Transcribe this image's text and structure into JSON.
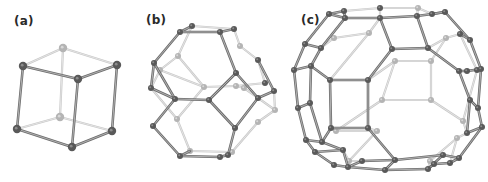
{
  "figure": {
    "panels": [
      {
        "id": "a",
        "label": "(a)",
        "shape": "cube",
        "label_pos": [
          14,
          14
        ]
      },
      {
        "id": "b",
        "label": "(b)",
        "shape": "truncated-octahedron",
        "label_pos": [
          146,
          13
        ]
      },
      {
        "id": "c",
        "label": "(c)",
        "shape": "truncated-cuboctahedron",
        "label_pos": [
          301,
          13
        ]
      }
    ],
    "colors": {
      "front_edge": "#6e6e6e",
      "back_edge": "#c8c8c8",
      "front_node": "#595959",
      "back_node": "#b4b4b4",
      "label": "#2a2a2a"
    },
    "models": {
      "a": {
        "nodes": [
          [
            63,
            48,
            0
          ],
          [
            23,
            66,
            1
          ],
          [
            117,
            65,
            1
          ],
          [
            78,
            79,
            1
          ],
          [
            60,
            117,
            0
          ],
          [
            17,
            129,
            1
          ],
          [
            112,
            131,
            1
          ],
          [
            72,
            147,
            1
          ]
        ],
        "edges": [
          [
            0,
            1,
            0
          ],
          [
            0,
            2,
            0
          ],
          [
            1,
            3,
            1
          ],
          [
            2,
            3,
            1
          ],
          [
            4,
            5,
            0
          ],
          [
            4,
            6,
            0
          ],
          [
            5,
            7,
            1
          ],
          [
            6,
            7,
            1
          ],
          [
            0,
            4,
            0
          ],
          [
            1,
            5,
            1
          ],
          [
            2,
            6,
            1
          ],
          [
            3,
            7,
            1
          ]
        ]
      },
      "b": {
        "nodes": [
          [
            180,
            32,
            1
          ],
          [
            192,
            26,
            1
          ],
          [
            220,
            32,
            1
          ],
          [
            234,
            29,
            1
          ],
          [
            154,
            63,
            1
          ],
          [
            178,
            56,
            0
          ],
          [
            240,
            46,
            0
          ],
          [
            258,
            60,
            1
          ],
          [
            151,
            88,
            1
          ],
          [
            160,
            70,
            0
          ],
          [
            204,
            87,
            0
          ],
          [
            236,
            86,
            0
          ],
          [
            265,
            83,
            1
          ],
          [
            175,
            99,
            1
          ],
          [
            209,
            100,
            1
          ],
          [
            236,
            73,
            1
          ],
          [
            258,
            98,
            1
          ],
          [
            274,
            91,
            1
          ],
          [
            244,
            88,
            0
          ],
          [
            275,
            110,
            0
          ],
          [
            153,
            126,
            1
          ],
          [
            177,
            119,
            0
          ],
          [
            235,
            128,
            1
          ],
          [
            258,
            122,
            0
          ],
          [
            180,
            156,
            1
          ],
          [
            190,
            151,
            0
          ],
          [
            220,
            157,
            1
          ],
          [
            232,
            152,
            0
          ],
          [
            228,
            155,
            1
          ]
        ],
        "edges": [
          [
            0,
            1,
            1
          ],
          [
            1,
            3,
            0
          ],
          [
            0,
            2,
            1
          ],
          [
            2,
            3,
            1
          ],
          [
            0,
            4,
            1
          ],
          [
            1,
            5,
            0
          ],
          [
            3,
            6,
            0
          ],
          [
            2,
            15,
            1
          ],
          [
            6,
            7,
            0
          ],
          [
            4,
            8,
            1
          ],
          [
            5,
            9,
            0
          ],
          [
            8,
            9,
            0
          ],
          [
            4,
            13,
            1
          ],
          [
            9,
            10,
            0
          ],
          [
            10,
            11,
            0
          ],
          [
            10,
            21,
            0
          ],
          [
            5,
            10,
            0
          ],
          [
            8,
            13,
            1
          ],
          [
            13,
            14,
            1
          ],
          [
            14,
            15,
            1
          ],
          [
            15,
            16,
            1
          ],
          [
            16,
            17,
            1
          ],
          [
            7,
            17,
            1
          ],
          [
            7,
            12,
            0
          ],
          [
            11,
            12,
            0
          ],
          [
            11,
            18,
            0
          ],
          [
            18,
            19,
            0
          ],
          [
            17,
            19,
            0
          ],
          [
            13,
            20,
            1
          ],
          [
            20,
            24,
            1
          ],
          [
            8,
            21,
            0
          ],
          [
            21,
            25,
            0
          ],
          [
            24,
            25,
            1
          ],
          [
            24,
            26,
            1
          ],
          [
            25,
            27,
            0
          ],
          [
            26,
            27,
            0
          ],
          [
            26,
            28,
            1
          ],
          [
            14,
            22,
            1
          ],
          [
            22,
            28,
            1
          ],
          [
            16,
            22,
            1
          ],
          [
            19,
            23,
            0
          ],
          [
            23,
            27,
            0
          ]
        ]
      },
      "c": {
        "nodes": [
          [
            329,
            14,
            1
          ],
          [
            344,
            11,
            1
          ],
          [
            345,
            18,
            1
          ],
          [
            380,
            8,
            1
          ],
          [
            418,
            8,
            0
          ],
          [
            432,
            14,
            1
          ],
          [
            445,
            12,
            1
          ],
          [
            380,
            18,
            1
          ],
          [
            417,
            16,
            1
          ],
          [
            305,
            44,
            1
          ],
          [
            321,
            48,
            1
          ],
          [
            334,
            38,
            0
          ],
          [
            369,
            33,
            0
          ],
          [
            392,
            49,
            1
          ],
          [
            428,
            48,
            1
          ],
          [
            446,
            38,
            0
          ],
          [
            460,
            34,
            1
          ],
          [
            470,
            40,
            1
          ],
          [
            294,
            70,
            1
          ],
          [
            311,
            66,
            1
          ],
          [
            330,
            80,
            1
          ],
          [
            368,
            80,
            1
          ],
          [
            395,
            61,
            0
          ],
          [
            431,
            61,
            0
          ],
          [
            459,
            71,
            1
          ],
          [
            467,
            71,
            1
          ],
          [
            477,
            70,
            1
          ],
          [
            481,
            69,
            1
          ],
          [
            298,
            108,
            1
          ],
          [
            310,
            103,
            1
          ],
          [
            382,
            100,
            0
          ],
          [
            431,
            100,
            0
          ],
          [
            470,
            100,
            1
          ],
          [
            478,
            108,
            1
          ],
          [
            306,
            140,
            1
          ],
          [
            322,
            142,
            1
          ],
          [
            331,
            128,
            1
          ],
          [
            368,
            128,
            1
          ],
          [
            336,
            131,
            0
          ],
          [
            377,
            131,
            0
          ],
          [
            463,
            121,
            0
          ],
          [
            467,
            133,
            1
          ],
          [
            482,
            127,
            1
          ],
          [
            315,
            152,
            1
          ],
          [
            343,
            150,
            1
          ],
          [
            349,
            161,
            0
          ],
          [
            362,
            161,
            1
          ],
          [
            395,
            160,
            1
          ],
          [
            430,
            161,
            0
          ],
          [
            443,
            155,
            1
          ],
          [
            457,
            138,
            0
          ],
          [
            459,
            158,
            1
          ],
          [
            334,
            165,
            1
          ],
          [
            348,
            167,
            1
          ],
          [
            385,
            170,
            1
          ],
          [
            428,
            169,
            1
          ],
          [
            434,
            164,
            1
          ],
          [
            450,
            163,
            1
          ]
        ],
        "edges": [
          [
            0,
            1,
            1
          ],
          [
            1,
            2,
            1
          ],
          [
            0,
            2,
            1
          ],
          [
            2,
            7,
            1
          ],
          [
            1,
            3,
            0
          ],
          [
            3,
            7,
            0
          ],
          [
            3,
            4,
            0
          ],
          [
            4,
            8,
            0
          ],
          [
            7,
            8,
            1
          ],
          [
            4,
            5,
            0
          ],
          [
            5,
            6,
            1
          ],
          [
            8,
            5,
            1
          ],
          [
            6,
            5,
            1
          ],
          [
            0,
            9,
            1
          ],
          [
            2,
            10,
            1
          ],
          [
            9,
            10,
            1
          ],
          [
            10,
            11,
            0
          ],
          [
            11,
            12,
            0
          ],
          [
            12,
            7,
            0
          ],
          [
            12,
            20,
            0
          ],
          [
            7,
            13,
            1
          ],
          [
            13,
            14,
            1
          ],
          [
            14,
            8,
            1
          ],
          [
            14,
            15,
            0
          ],
          [
            15,
            16,
            0
          ],
          [
            6,
            17,
            1
          ],
          [
            16,
            17,
            1
          ],
          [
            9,
            18,
            1
          ],
          [
            18,
            19,
            1
          ],
          [
            10,
            19,
            1
          ],
          [
            19,
            20,
            1
          ],
          [
            20,
            21,
            1
          ],
          [
            21,
            13,
            1
          ],
          [
            21,
            22,
            0
          ],
          [
            22,
            23,
            0
          ],
          [
            23,
            15,
            0
          ],
          [
            14,
            24,
            1
          ],
          [
            24,
            25,
            1
          ],
          [
            25,
            27,
            1
          ],
          [
            17,
            27,
            1
          ],
          [
            16,
            26,
            0
          ],
          [
            26,
            25,
            0
          ],
          [
            18,
            28,
            1
          ],
          [
            19,
            29,
            1
          ],
          [
            28,
            29,
            1
          ],
          [
            20,
            36,
            1
          ],
          [
            21,
            37,
            1
          ],
          [
            36,
            37,
            1
          ],
          [
            22,
            30,
            0
          ],
          [
            30,
            31,
            0
          ],
          [
            23,
            31,
            0
          ],
          [
            24,
            32,
            1
          ],
          [
            27,
            33,
            1
          ],
          [
            32,
            33,
            1
          ],
          [
            26,
            40,
            0
          ],
          [
            28,
            34,
            1
          ],
          [
            29,
            35,
            1
          ],
          [
            34,
            35,
            1
          ],
          [
            35,
            36,
            1
          ],
          [
            36,
            38,
            0
          ],
          [
            37,
            39,
            0
          ],
          [
            38,
            39,
            0
          ],
          [
            30,
            38,
            0
          ],
          [
            31,
            40,
            0
          ],
          [
            40,
            41,
            0
          ],
          [
            32,
            41,
            1
          ],
          [
            33,
            42,
            1
          ],
          [
            41,
            42,
            1
          ],
          [
            34,
            43,
            1
          ],
          [
            43,
            44,
            1
          ],
          [
            35,
            44,
            1
          ],
          [
            44,
            45,
            0
          ],
          [
            37,
            47,
            1
          ],
          [
            47,
            46,
            1
          ],
          [
            43,
            52,
            1
          ],
          [
            52,
            53,
            1
          ],
          [
            44,
            53,
            1
          ],
          [
            46,
            53,
            1
          ],
          [
            46,
            45,
            0
          ],
          [
            39,
            45,
            0
          ],
          [
            47,
            54,
            1
          ],
          [
            53,
            54,
            1
          ],
          [
            54,
            55,
            1
          ],
          [
            55,
            49,
            1
          ],
          [
            49,
            47,
            1
          ],
          [
            55,
            56,
            1
          ],
          [
            56,
            57,
            1
          ],
          [
            49,
            51,
            1
          ],
          [
            51,
            57,
            1
          ],
          [
            41,
            50,
            0
          ],
          [
            50,
            48,
            0
          ],
          [
            48,
            55,
            0
          ],
          [
            42,
            51,
            1
          ],
          [
            50,
            57,
            0
          ]
        ]
      }
    }
  }
}
